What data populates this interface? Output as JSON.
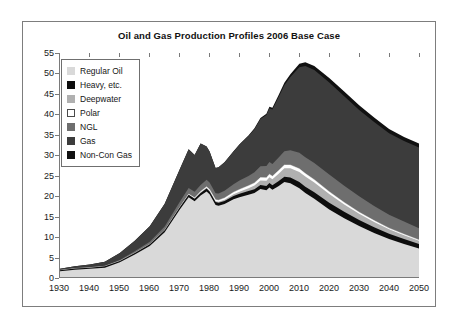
{
  "chart_data": {
    "type": "area",
    "title": "Oil and Gas Production Profiles 2006 Base Case",
    "xlabel": "",
    "ylabel": "",
    "xlim": [
      1930,
      2050
    ],
    "ylim": [
      0,
      55
    ],
    "grid": false,
    "stacked": true,
    "legend_position": "top-left-inside",
    "xticks": [
      1930,
      1940,
      1950,
      1960,
      1970,
      1980,
      1990,
      2000,
      2010,
      2020,
      2030,
      2040,
      2050
    ],
    "yticks": [
      0,
      5,
      10,
      15,
      20,
      25,
      30,
      35,
      40,
      45,
      50,
      55
    ],
    "x": [
      1930,
      1935,
      1940,
      1945,
      1950,
      1955,
      1960,
      1965,
      1970,
      1973,
      1975,
      1977,
      1979,
      1980,
      1982,
      1983,
      1985,
      1988,
      1990,
      1993,
      1995,
      1997,
      1999,
      2000,
      2001,
      2003,
      2005,
      2007,
      2010,
      2012,
      2015,
      2020,
      2025,
      2030,
      2035,
      2040,
      2045,
      2050
    ],
    "series": [
      {
        "name": "Regular Oil",
        "color": "#d9d9d9",
        "values": [
          1.4,
          1.8,
          2.0,
          2.3,
          3.6,
          5.5,
          7.6,
          11.0,
          16.5,
          19.6,
          18.6,
          20.0,
          21.0,
          20.3,
          17.7,
          17.5,
          17.9,
          19.1,
          19.6,
          20.2,
          20.6,
          21.6,
          21.3,
          22.0,
          21.4,
          22.3,
          23.3,
          23.0,
          21.8,
          20.6,
          19.2,
          16.6,
          14.4,
          12.5,
          10.8,
          9.3,
          8.1,
          7.0
        ]
      },
      {
        "name": "Heavy, etc.",
        "color": "#0d0d0d",
        "values": [
          0.25,
          0.28,
          0.3,
          0.32,
          0.35,
          0.4,
          0.45,
          0.5,
          0.55,
          0.6,
          0.6,
          0.65,
          0.7,
          0.7,
          0.7,
          0.72,
          0.75,
          0.8,
          0.85,
          0.9,
          0.95,
          1.0,
          1.05,
          1.1,
          1.1,
          1.2,
          1.3,
          1.4,
          1.5,
          1.55,
          1.6,
          1.65,
          1.6,
          1.5,
          1.4,
          1.3,
          1.2,
          1.1
        ]
      },
      {
        "name": "Deepwater",
        "color": "#b0b0b0",
        "values": [
          0.0,
          0.0,
          0.0,
          0.0,
          0.0,
          0.0,
          0.0,
          0.0,
          0.0,
          0.05,
          0.1,
          0.15,
          0.2,
          0.2,
          0.2,
          0.25,
          0.3,
          0.4,
          0.5,
          0.7,
          0.9,
          1.1,
          1.3,
          1.4,
          1.5,
          1.8,
          2.1,
          2.3,
          2.5,
          2.5,
          2.4,
          2.1,
          1.8,
          1.5,
          1.3,
          1.1,
          0.95,
          0.8
        ]
      },
      {
        "name": "Polar",
        "color": "#ffffff",
        "values": [
          0.0,
          0.0,
          0.0,
          0.0,
          0.0,
          0.0,
          0.0,
          0.0,
          0.05,
          0.1,
          0.15,
          0.2,
          0.25,
          0.3,
          0.35,
          0.4,
          0.45,
          0.5,
          0.55,
          0.6,
          0.65,
          0.7,
          0.72,
          0.75,
          0.75,
          0.78,
          0.8,
          0.8,
          0.78,
          0.75,
          0.7,
          0.6,
          0.5,
          0.42,
          0.35,
          0.3,
          0.25,
          0.2
        ]
      },
      {
        "name": "NGL",
        "color": "#6e6e6e",
        "values": [
          0.05,
          0.08,
          0.1,
          0.15,
          0.25,
          0.4,
          0.6,
          0.9,
          1.3,
          1.5,
          1.5,
          1.6,
          1.7,
          1.7,
          1.6,
          1.65,
          1.8,
          2.0,
          2.2,
          2.4,
          2.6,
          2.8,
          2.9,
          3.0,
          3.0,
          3.2,
          3.4,
          3.6,
          3.9,
          4.0,
          4.1,
          4.2,
          4.1,
          3.9,
          3.6,
          3.3,
          3.1,
          2.9
        ]
      },
      {
        "name": "Gas",
        "color": "#3c3c3c",
        "values": [
          0.3,
          0.45,
          0.7,
          1.0,
          1.7,
          2.6,
          3.8,
          5.6,
          8.0,
          9.5,
          9.0,
          10.2,
          8.2,
          7.6,
          6.2,
          6.4,
          7.0,
          8.0,
          8.8,
          9.8,
          10.6,
          11.6,
          12.5,
          13.2,
          13.4,
          14.8,
          16.2,
          18.0,
          21.0,
          22.4,
          22.8,
          22.6,
          22.0,
          21.2,
          20.6,
          20.0,
          19.8,
          19.8
        ]
      },
      {
        "name": "Non-Con Gas",
        "color": "#111111",
        "values": [
          0.0,
          0.0,
          0.0,
          0.0,
          0.0,
          0.0,
          0.0,
          0.0,
          0.0,
          0.0,
          0.0,
          0.0,
          0.0,
          0.0,
          0.0,
          0.0,
          0.0,
          0.05,
          0.1,
          0.15,
          0.2,
          0.25,
          0.3,
          0.35,
          0.4,
          0.5,
          0.6,
          0.7,
          0.85,
          0.95,
          1.0,
          1.1,
          1.15,
          1.15,
          1.1,
          1.05,
          1.0,
          0.95
        ]
      }
    ],
    "totals_note": "Peak total approximately 52 around 2012; 2050 total approximately 33",
    "legend": [
      {
        "label": "Regular Oil",
        "color": "#d9d9d9"
      },
      {
        "label": "Heavy, etc.",
        "color": "#0d0d0d"
      },
      {
        "label": "Deepwater",
        "color": "#b0b0b0"
      },
      {
        "label": "Polar",
        "color": "#ffffff"
      },
      {
        "label": "NGL",
        "color": "#6e6e6e"
      },
      {
        "label": "Gas",
        "color": "#3c3c3c"
      },
      {
        "label": "Non-Con Gas",
        "color": "#111111"
      }
    ]
  }
}
